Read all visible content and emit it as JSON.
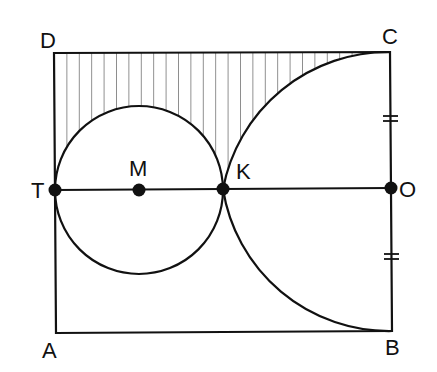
{
  "diagram": {
    "labels": {
      "D": "D",
      "C": "C",
      "T": "T",
      "M": "M",
      "K": "K",
      "O": "O",
      "A": "A",
      "B": "B"
    },
    "points": {
      "D": [
        54,
        53
      ],
      "C": [
        390,
        52
      ],
      "T": [
        55,
        190
      ],
      "M": [
        139,
        190
      ],
      "K": [
        223,
        189
      ],
      "O": [
        391,
        188
      ],
      "A": [
        56,
        333
      ],
      "B": [
        392,
        331
      ]
    },
    "shapes": {
      "rectangle": "ABCD",
      "circle": {
        "center": "M",
        "radius": 84
      },
      "arc": {
        "center": "O",
        "from": "C",
        "through": "K",
        "to": "B",
        "radius": 168
      },
      "segment": "TO",
      "tick_marks": [
        "CO",
        "OB"
      ],
      "shaded_region": "region between DC, circle M and arc OC (vertical hatching)"
    },
    "colors": {
      "stroke": "#111111",
      "hatch": "#333333",
      "background": "#ffffff"
    }
  }
}
